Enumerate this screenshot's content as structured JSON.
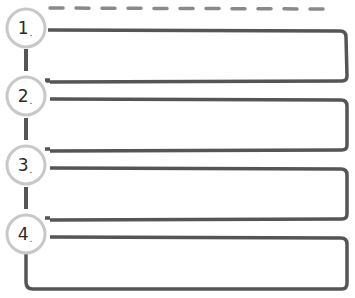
{
  "diagram": {
    "type": "numbered-step-list-template",
    "colors": {
      "line": "#555555",
      "circle": "#c8c8c8",
      "dash": "#8a8a8a",
      "text": "#2a2a2a"
    },
    "steps": [
      {
        "number": "1",
        "suffix": "."
      },
      {
        "number": "2",
        "suffix": "."
      },
      {
        "number": "3",
        "suffix": "."
      },
      {
        "number": "4",
        "suffix": "."
      }
    ]
  }
}
